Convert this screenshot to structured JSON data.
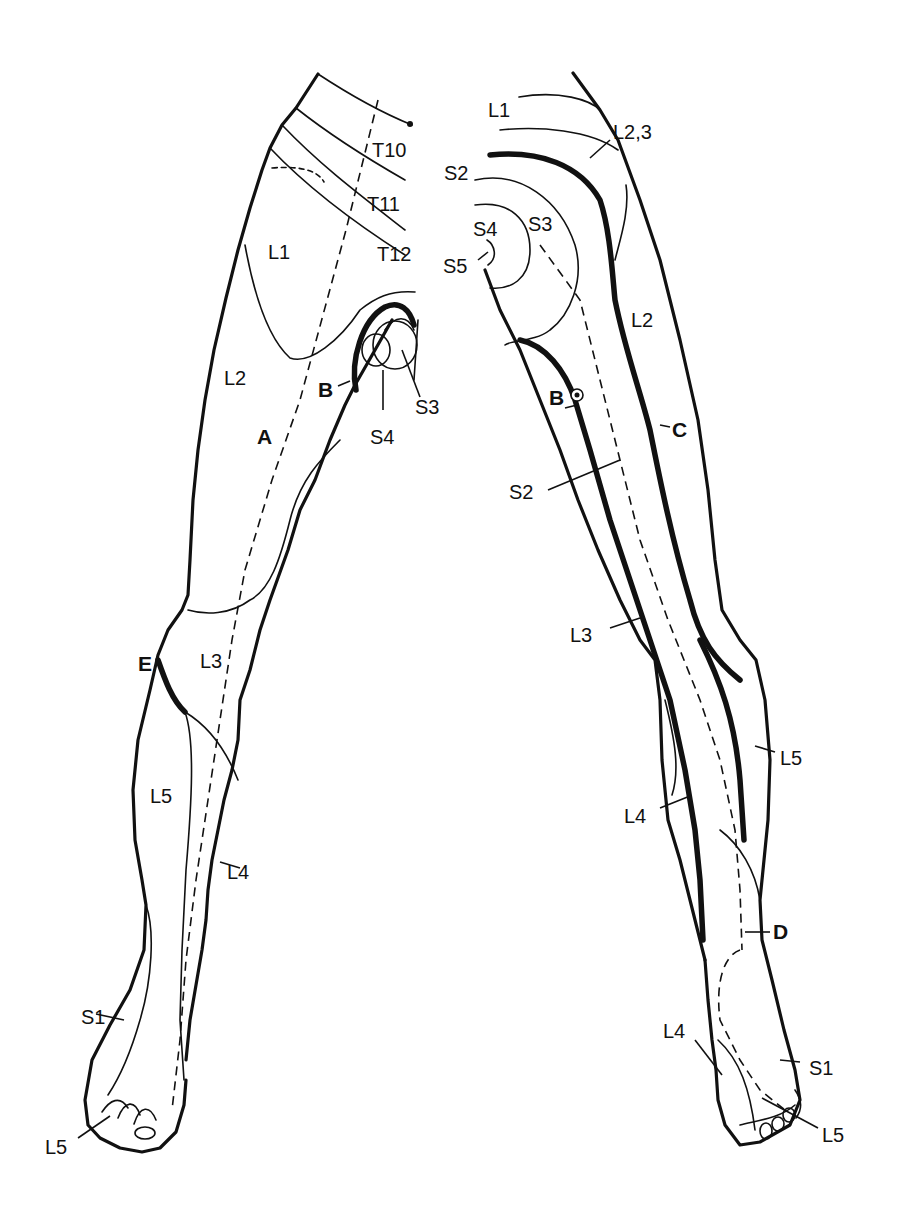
{
  "figure": {
    "colors": {
      "ink": "#111111",
      "background": "#ffffff"
    }
  },
  "anterior_view": {
    "labels": [
      {
        "id": "T10",
        "text": "T10",
        "x": 372,
        "y": 140
      },
      {
        "id": "T11",
        "text": "T11",
        "x": 367,
        "y": 194
      },
      {
        "id": "T12",
        "text": "T12",
        "x": 377,
        "y": 244
      },
      {
        "id": "L1",
        "text": "L1",
        "x": 268,
        "y": 242
      },
      {
        "id": "L2",
        "text": "L2",
        "x": 224,
        "y": 368
      },
      {
        "id": "S3",
        "text": "S3",
        "x": 415,
        "y": 397
      },
      {
        "id": "S4",
        "text": "S4",
        "x": 370,
        "y": 427
      },
      {
        "id": "L3",
        "text": "L3",
        "x": 200,
        "y": 651
      },
      {
        "id": "L5",
        "text": "L5",
        "x": 150,
        "y": 786
      },
      {
        "id": "L4",
        "text": "L4",
        "x": 227,
        "y": 862
      },
      {
        "id": "S1",
        "text": "S1",
        "x": 81,
        "y": 1007
      },
      {
        "id": "L5-toe",
        "text": "L5",
        "x": 45,
        "y": 1137
      }
    ],
    "markers": [
      {
        "id": "A",
        "text": "A",
        "x": 257,
        "y": 426
      },
      {
        "id": "B",
        "text": "B",
        "x": 318,
        "y": 379
      },
      {
        "id": "E",
        "text": "E",
        "x": 138,
        "y": 653
      }
    ]
  },
  "posterior_view": {
    "labels": [
      {
        "id": "L1",
        "text": "L1",
        "x": 488,
        "y": 100
      },
      {
        "id": "L2,3",
        "text": "L2,3",
        "x": 613,
        "y": 122
      },
      {
        "id": "S2",
        "text": "S2",
        "x": 444,
        "y": 163
      },
      {
        "id": "S4",
        "text": "S4",
        "x": 473,
        "y": 219
      },
      {
        "id": "S3",
        "text": "S3",
        "x": 528,
        "y": 214
      },
      {
        "id": "S5",
        "text": "S5",
        "x": 443,
        "y": 256
      },
      {
        "id": "L2",
        "text": "L2",
        "x": 631,
        "y": 310
      },
      {
        "id": "S2-lower",
        "text": "S2",
        "x": 509,
        "y": 482
      },
      {
        "id": "L3",
        "text": "L3",
        "x": 570,
        "y": 625
      },
      {
        "id": "L5",
        "text": "L5",
        "x": 780,
        "y": 748
      },
      {
        "id": "L4",
        "text": "L4",
        "x": 624,
        "y": 806
      },
      {
        "id": "L4-foot",
        "text": "L4",
        "x": 663,
        "y": 1021
      },
      {
        "id": "S1",
        "text": "S1",
        "x": 809,
        "y": 1058
      },
      {
        "id": "L5-foot",
        "text": "L5",
        "x": 822,
        "y": 1125
      }
    ],
    "markers": [
      {
        "id": "B",
        "text": "B",
        "x": 549,
        "y": 387
      },
      {
        "id": "C",
        "text": "C",
        "x": 672,
        "y": 419
      },
      {
        "id": "D",
        "text": "D",
        "x": 773,
        "y": 921
      }
    ]
  }
}
